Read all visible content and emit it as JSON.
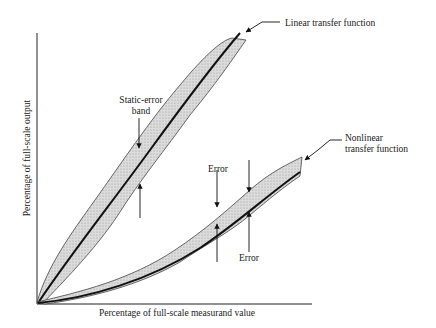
{
  "diagram": {
    "axes": {
      "x_label": "Percentage of full-scale measurand value",
      "y_label": "Percentage of full-scale output"
    },
    "annotations": {
      "linear_label": "Linear transfer function",
      "static_error_line1": "Static-error",
      "static_error_line2": "band",
      "nonlinear_line1": "Nonlinear",
      "nonlinear_line2": "transfer function",
      "error_upper": "Error",
      "error_lower": "Error"
    },
    "colors": {
      "band_fill": "#cfcfcf",
      "line": "#111111",
      "band_edge": "#444444"
    }
  }
}
